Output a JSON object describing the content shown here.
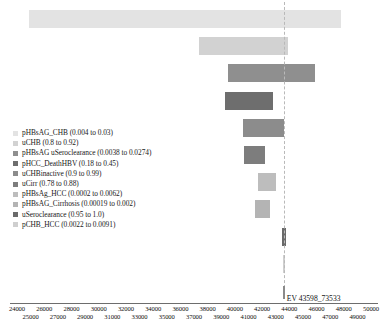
{
  "chart_data": {
    "type": "bar",
    "subtype": "tornado",
    "title": "",
    "xlabel": "",
    "ylabel": "",
    "xlim": [
      24000,
      50000
    ],
    "grid": false,
    "legend_position": "left-middle",
    "expected_value": 43598.73533,
    "expected_value_label": "EV 43598_73533",
    "axis_ticks_top": [
      24000,
      26000,
      28000,
      30000,
      32000,
      34000,
      36000,
      38000,
      40000,
      42000,
      44000,
      46000,
      48000,
      50000
    ],
    "axis_ticks_bottom": [
      25000,
      27000,
      29000,
      31000,
      33000,
      35000,
      37000,
      39000,
      41000,
      43000,
      45000,
      47000,
      49000
    ],
    "categories": [
      "pHBsAG_CHB",
      "uCHB",
      "pHBsAG uSeroclearance",
      "pHCC_DeathHBV",
      "uCHBinactive",
      "uCirr",
      "pHBsAg_HCC",
      "pHBsAG_Cirrhosis",
      "uSeroclearance",
      "pCHB_HCC"
    ],
    "bars": [
      {
        "label": "pHBsAG_CHB (0.004 to 0.03)",
        "low": 24900,
        "high": 47800,
        "color": "#e3e3e3"
      },
      {
        "label": "uCHB (0.8 to 0.92)",
        "low": 37400,
        "high": 43900,
        "color": "#d2d2d2"
      },
      {
        "label": "pHBsAG uSeroclearance (0.0038 to 0.0274)",
        "low": 39500,
        "high": 45900,
        "color": "#8f8f8f"
      },
      {
        "label": "pHCC_DeathHBV (0.18 to 0.45)",
        "low": 39300,
        "high": 42800,
        "color": "#6e6e6e"
      },
      {
        "label": "uCHBinactive (0.9 to 0.99)",
        "low": 40600,
        "high": 43600,
        "color": "#8c8c8c"
      },
      {
        "label": "uCirr (0.78 to 0.88)",
        "low": 40700,
        "high": 42200,
        "color": "#7d7d7d"
      },
      {
        "label": "pHBsAg_HCC (0.0002 to 0.0062)",
        "low": 41700,
        "high": 43000,
        "color": "#bdbdbd"
      },
      {
        "label": "pHBsAG_Cirrhosis (0.00019 to 0.002)",
        "low": 41500,
        "high": 42600,
        "color": "#b4b4b4"
      },
      {
        "label": "uSeroclearance (0.95 to 1.0)",
        "low": 43470,
        "high": 43760,
        "color": "#6a6a6a"
      },
      {
        "label": "pCHB_HCC (0.0022 to 0.0091)",
        "low": 43530,
        "high": 43720,
        "color": "#cfcfcf"
      }
    ]
  },
  "legend": {
    "items": [
      {
        "label": "pHBsAG_CHB (0.004 to 0.03)",
        "color": "#e3e3e3"
      },
      {
        "label": "uCHB (0.8 to 0.92)",
        "color": "#d2d2d2"
      },
      {
        "label": "pHBsAG uSeroclearance (0.0038 to 0.0274)",
        "color": "#8f8f8f"
      },
      {
        "label": "pHCC_DeathHBV (0.18 to 0.45)",
        "color": "#6e6e6e"
      },
      {
        "label": "uCHBinactive (0.9 to 0.99)",
        "color": "#8c8c8c"
      },
      {
        "label": "uCirr (0.78 to 0.88)",
        "color": "#7d7d7d"
      },
      {
        "label": "pHBsAg_HCC (0.0002 to 0.0062)",
        "color": "#bdbdbd"
      },
      {
        "label": "pHBsAG_Cirrhosis (0.00019 to 0.002)",
        "color": "#b4b4b4"
      },
      {
        "label": "uSeroclearance (0.95 to 1.0)",
        "color": "#6a6a6a"
      },
      {
        "label": "pCHB_HCC (0.0022 to 0.0091)",
        "color": "#cfcfcf"
      }
    ]
  }
}
